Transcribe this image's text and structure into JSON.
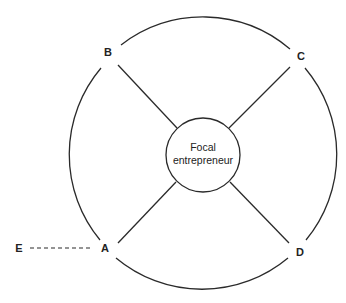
{
  "diagram": {
    "center_node": {
      "line1": "Focal",
      "line2": "entrepreneur"
    },
    "nodes": [
      {
        "id": "A",
        "label": "A"
      },
      {
        "id": "B",
        "label": "B"
      },
      {
        "id": "C",
        "label": "C"
      },
      {
        "id": "D",
        "label": "D"
      },
      {
        "id": "E",
        "label": "E"
      }
    ],
    "edges": [
      {
        "from": "Focal entrepreneur",
        "to": "A",
        "style": "solid"
      },
      {
        "from": "Focal entrepreneur",
        "to": "B",
        "style": "solid"
      },
      {
        "from": "Focal entrepreneur",
        "to": "C",
        "style": "solid"
      },
      {
        "from": "Focal entrepreneur",
        "to": "D",
        "style": "solid"
      },
      {
        "from": "A",
        "to": "B",
        "style": "arc"
      },
      {
        "from": "B",
        "to": "C",
        "style": "arc"
      },
      {
        "from": "C",
        "to": "D",
        "style": "arc"
      },
      {
        "from": "D",
        "to": "A",
        "style": "arc"
      },
      {
        "from": "E",
        "to": "A",
        "style": "dashed"
      }
    ],
    "colors": {
      "line": "#2a2a2a",
      "background": "#ffffff"
    }
  }
}
